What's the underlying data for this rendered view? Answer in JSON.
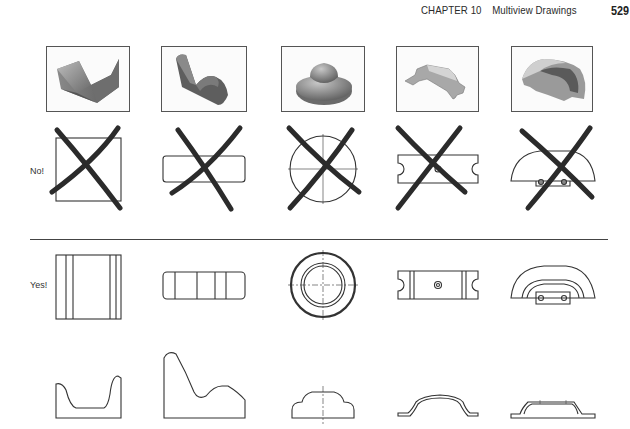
{
  "header": {
    "chapter": "CHAPTER 10",
    "title": "Multiview Drawings",
    "page_number": "529"
  },
  "rows": {
    "no_label": "No!",
    "yes_label": "Yes!"
  },
  "figures": [
    {
      "object": "v-block",
      "photo": "shaded-v-block",
      "incorrect_view": "square-crossed-out",
      "front_view": "rectangle-with-vertical-lines",
      "side_view": "u-channel-profile"
    },
    {
      "object": "angled-bracket",
      "photo": "shaded-angled-block",
      "incorrect_view": "rounded-rectangle-crossed-out",
      "front_view": "rounded-rectangle-segmented",
      "side_view": "wave-profile"
    },
    {
      "object": "stepped-cap",
      "photo": "shaded-stepped-cap",
      "incorrect_view": "circle-with-centerlines-crossed-out",
      "front_view": "concentric-circles",
      "side_view": "stepped-dome-profile"
    },
    {
      "object": "strap-bracket",
      "photo": "shaded-strap-bracket",
      "incorrect_view": "slotted-rectangle-crossed-out",
      "front_view": "slotted-rectangle-with-hole",
      "side_view": "arched-strap-profile"
    },
    {
      "object": "hood-cover",
      "photo": "shaded-hood-cover",
      "incorrect_view": "half-round-crossed-out",
      "front_view": "half-round-with-tab",
      "side_view": "flanged-hat-profile"
    }
  ],
  "colors": {
    "line": "#333333",
    "cross": "#2b2b2b",
    "photo_border": "#555555"
  }
}
